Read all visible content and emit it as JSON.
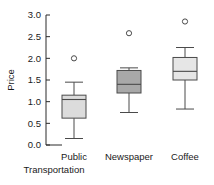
{
  "chart_data": {
    "type": "box",
    "title": "",
    "xlabel": "",
    "ylabel": "Price",
    "ylim": [
      0.0,
      3.0
    ],
    "ytick_values": [
      0.0,
      0.5,
      1.0,
      1.5,
      2.0,
      2.5,
      3.0
    ],
    "ytick_labels": [
      "0.0",
      "0.5",
      "1.0",
      "1.5",
      "2.0",
      "2.5",
      "3.0"
    ],
    "grid": false,
    "legend": null,
    "categories": [
      "Public Transportation",
      "Newspaper",
      "Coffee"
    ],
    "boxes": [
      {
        "category": "Public Transportation",
        "label_line1": "Public",
        "label_line2": "Transportation",
        "whisker_low": 0.15,
        "q1": 0.62,
        "median": 1.05,
        "q3": 1.15,
        "whisker_high": 1.45,
        "outliers": [
          2.0
        ],
        "fill": "#dcdcdc"
      },
      {
        "category": "Newspaper",
        "label_line1": "Newspaper",
        "label_line2": "",
        "whisker_low": 0.75,
        "q1": 1.2,
        "median": 1.4,
        "q3": 1.72,
        "whisker_high": 1.78,
        "outliers": [
          2.58
        ],
        "fill": "#a8a8a8"
      },
      {
        "category": "Coffee",
        "label_line1": "Coffee",
        "label_line2": "",
        "whisker_low": 0.83,
        "q1": 1.5,
        "median": 1.7,
        "q3": 2.02,
        "whisker_high": 2.25,
        "outliers": [
          2.85
        ],
        "fill": "#e6e6e6"
      }
    ],
    "colors": {
      "axis": "#2b2b2b",
      "outline": "#4a4a4a",
      "background": "#ffffff"
    }
  }
}
